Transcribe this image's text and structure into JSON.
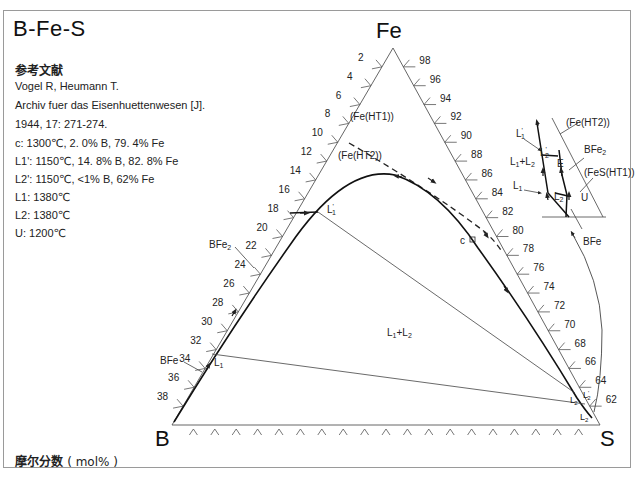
{
  "title": "B-Fe-S",
  "reference": {
    "heading": "参考文献",
    "authors": "Vogel R,  Heumann T.",
    "journal": "Archiv fuer das Eisenhuettenwesen [J].",
    "citation": "1944,  17:  271-274."
  },
  "points": [
    {
      "name": "c",
      "text": "c:  1300℃,  2. 0% B,  79. 4% Fe"
    },
    {
      "name": "L1'",
      "text": "L1':  1150℃,  14. 8% B,  82. 8% Fe"
    },
    {
      "name": "L2'",
      "text": "L2':  1150℃,  <1% B,  62% Fe"
    },
    {
      "name": "L1",
      "text": "L1:  1380℃"
    },
    {
      "name": "L2",
      "text": "L2:  1380℃"
    },
    {
      "name": "U",
      "text": "U:  1200℃"
    }
  ],
  "footer": {
    "label": "摩尔分数",
    "unit": "( mol% )"
  },
  "diagram": {
    "vertices": {
      "top": "Fe",
      "left": "B",
      "right": "S"
    },
    "left_edge_ticks": [
      "2",
      "4",
      "6",
      "8",
      "10",
      "12",
      "14",
      "16",
      "18",
      "20",
      "22",
      "24",
      "26",
      "28",
      "30",
      "32",
      "34",
      "36",
      "38"
    ],
    "right_edge_ticks": [
      "98",
      "96",
      "94",
      "92",
      "90",
      "88",
      "86",
      "84",
      "82",
      "80",
      "78",
      "76",
      "74",
      "72",
      "70",
      "68",
      "66",
      "64",
      "62"
    ],
    "phase_labels": {
      "fe_ht1": "(Fe(HT1))",
      "fe_ht2": "(Fe(HT2))",
      "l1l2": "L1+L2",
      "bfe2": "BFe2",
      "bfe": "BFe",
      "c": "c",
      "l1p": "L1'",
      "l1": "L1",
      "l2p": "L2'",
      "l2": "L2"
    },
    "inset": {
      "fe_ht2": "(Fe(HT2))",
      "bfe2": "BFe2",
      "fes_ht1": "(FeS(HT1))",
      "l1p": "L1'",
      "l2p": "L2'",
      "e": "E",
      "l1l2": "L1+L2",
      "l1": "L1",
      "l2": "L2",
      "u": "U",
      "bfe": "BFe"
    }
  }
}
